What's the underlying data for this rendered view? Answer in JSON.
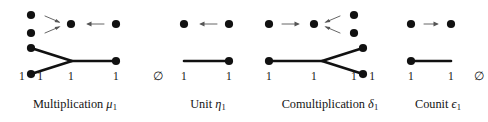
{
  "figure": {
    "background_color": "#ffffff",
    "ink_color": "#111111",
    "arrow_color": "#555555",
    "panels": [
      {
        "id": "multiplication",
        "caption_text": "Multiplication",
        "caption_symbol": "μ",
        "caption_subscript": "1",
        "object_labels": [
          "1 + 1",
          "1",
          "1"
        ],
        "top_row": {
          "nodes": [
            "dot",
            "dot",
            "dot",
            "dot"
          ],
          "arrows": [
            "right-pair",
            "left"
          ]
        },
        "graph": {
          "shape": "merge-y",
          "description": "two left vertices joining into one right vertex"
        }
      },
      {
        "id": "unit",
        "caption_text": "Unit",
        "caption_symbol": "η",
        "caption_subscript": "1",
        "object_labels": [
          "∅",
          "1",
          "1"
        ],
        "top_row": {
          "nodes": [
            "dot",
            "dot"
          ],
          "arrows": [
            "left"
          ]
        },
        "graph": {
          "shape": "line-right-dot",
          "description": "horizontal segment terminating in a right vertex"
        }
      },
      {
        "id": "comultiplication",
        "caption_text": "Comultiplication",
        "caption_symbol": "δ",
        "caption_subscript": "1",
        "object_labels": [
          "1",
          "1",
          "1 + 1"
        ],
        "top_row": {
          "nodes": [
            "dot",
            "dot",
            "dot",
            "dot"
          ],
          "arrows": [
            "right",
            "left-pair"
          ]
        },
        "graph": {
          "shape": "split-y",
          "description": "one left vertex splitting into two right vertices"
        }
      },
      {
        "id": "counit",
        "caption_text": "Counit",
        "caption_symbol": "ϵ",
        "caption_subscript": "1",
        "object_labels": [
          "1",
          "1",
          "∅"
        ],
        "top_row": {
          "nodes": [
            "dot",
            "dot"
          ],
          "arrows": [
            "right"
          ]
        },
        "graph": {
          "shape": "line-left-dot",
          "description": "left vertex with horizontal segment extending right"
        }
      }
    ]
  }
}
